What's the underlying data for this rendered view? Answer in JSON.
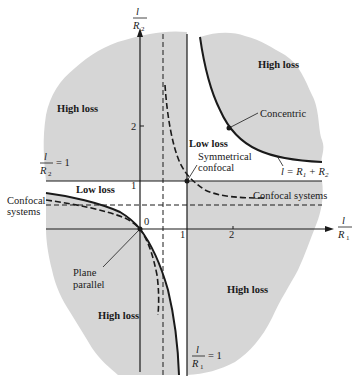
{
  "diagram": {
    "x_axis": {
      "num": "l",
      "den": "R",
      "sub": "1",
      "ticks": [
        "1",
        "2"
      ]
    },
    "y_axis": {
      "num": "l",
      "den": "R",
      "sub": "2",
      "ticks": [
        "1",
        "2"
      ]
    },
    "origin_label": "0",
    "boundary_labels": {
      "r2_eq_1": {
        "num": "l",
        "den": "R",
        "sub": "2",
        "rhs": "= 1"
      },
      "r1_eq_1": {
        "num": "l",
        "den": "R",
        "sub": "1",
        "rhs": "= 1"
      },
      "concentric_eq": {
        "lhs": "l = R",
        "sub1": "1",
        "plus": " + R",
        "sub2": "2"
      }
    },
    "region_labels": {
      "high_loss_upper_left": "High loss",
      "high_loss_upper_right": "High loss",
      "high_loss_lower_left": "High loss",
      "high_loss_lower_right": "High loss",
      "low_loss_center": "Low loss",
      "low_loss_left": "Low loss"
    },
    "annotations": {
      "concentric": "Concentric",
      "symmetrical_confocal_1": "Symmetrical",
      "symmetrical_confocal_2": "confocal",
      "confocal_systems_right": "Confocal systems",
      "confocal_systems_left_1": "Confocal",
      "confocal_systems_left_2": "systems",
      "plane_parallel_1": "Plane",
      "plane_parallel_2": "parallel"
    },
    "colors": {
      "high_loss_fill": "#d6d6d6",
      "line": "#1a1a1a",
      "background": "#ffffff"
    }
  }
}
